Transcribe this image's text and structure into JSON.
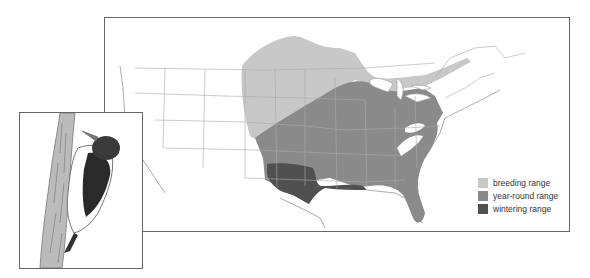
{
  "map": {
    "region": "United States and southern Canada",
    "legend": [
      {
        "label": "breeding range",
        "color": "#c8c8c8"
      },
      {
        "label": "year-round range",
        "color": "#8a8a8a"
      },
      {
        "label": "wintering range",
        "color": "#505050"
      }
    ]
  },
  "inset": {
    "subject": "woodpecker on tree trunk"
  }
}
